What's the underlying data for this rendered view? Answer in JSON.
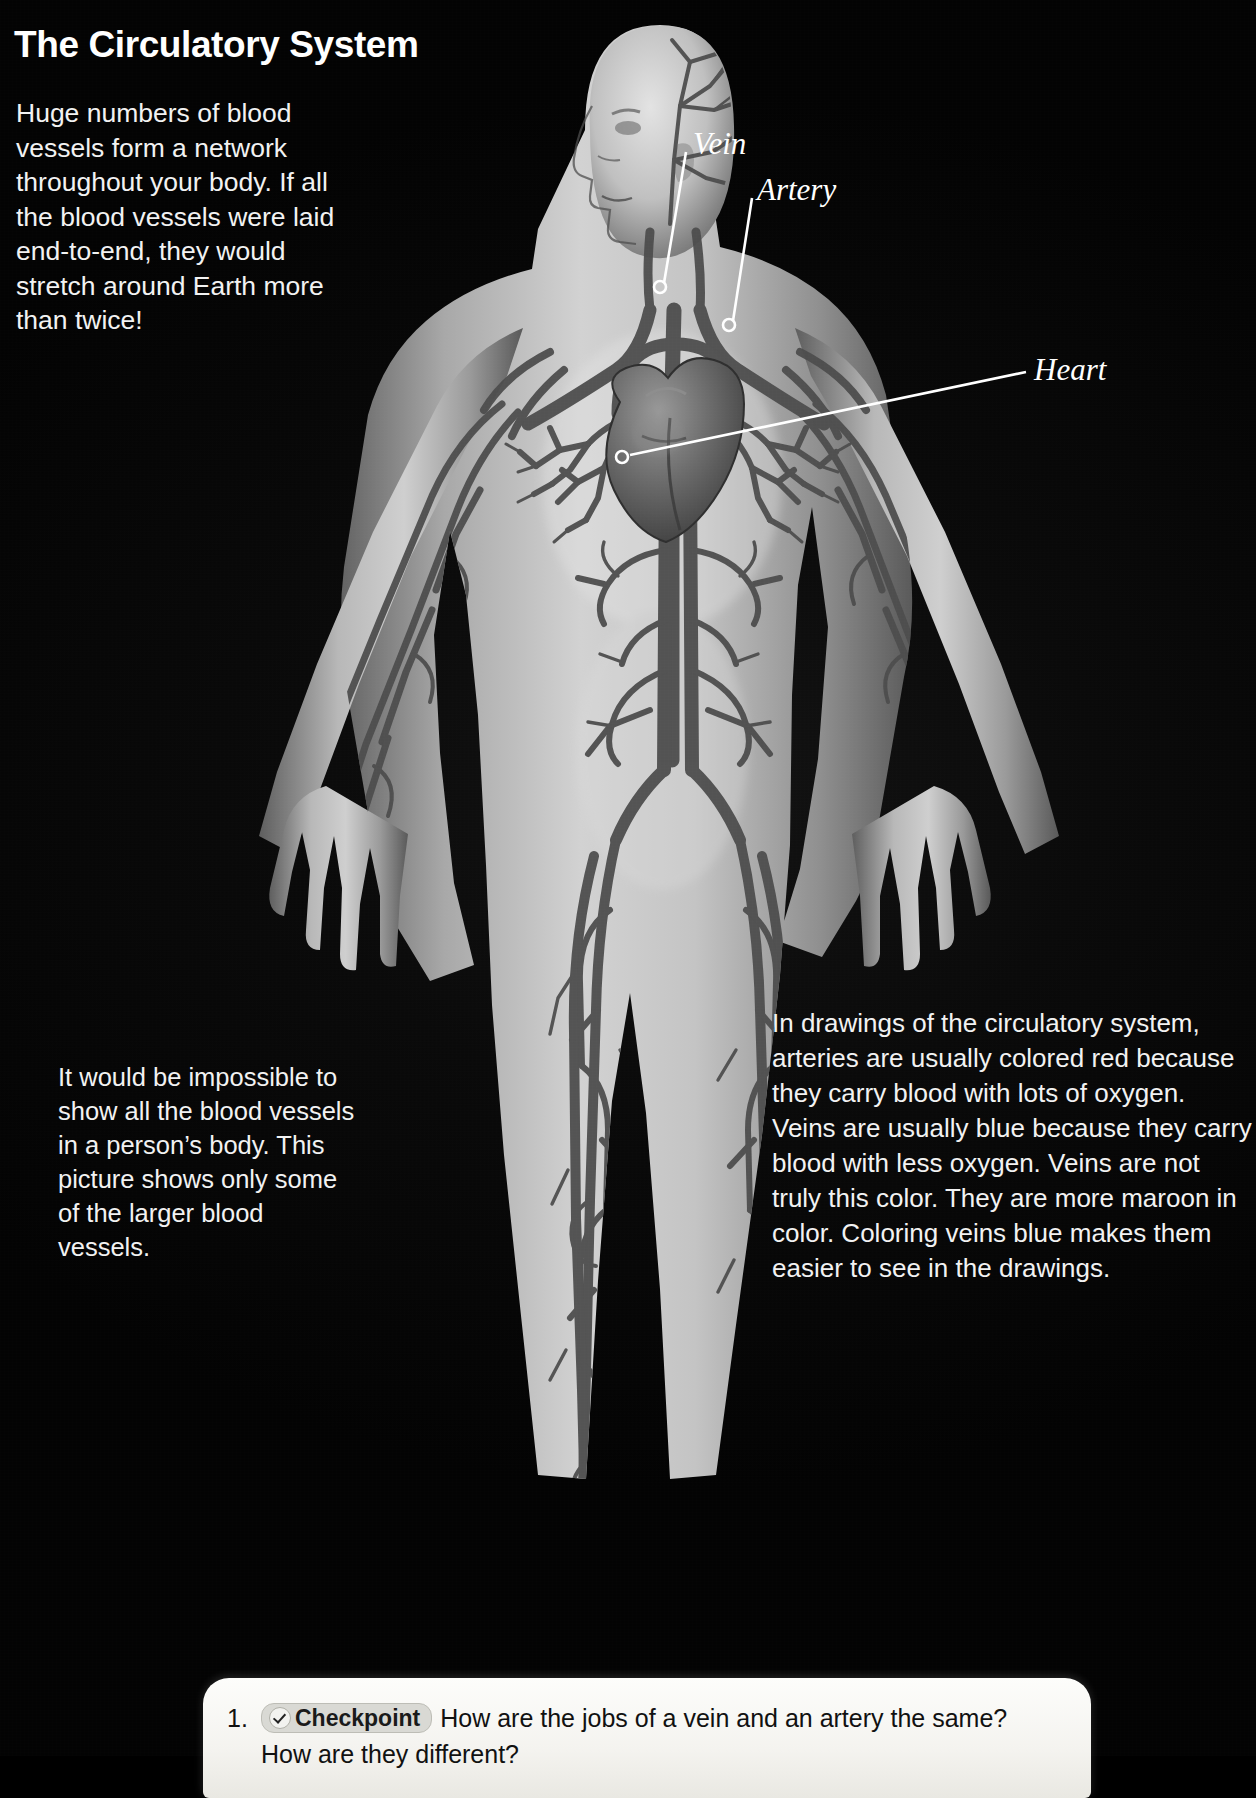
{
  "page": {
    "title": "The Circulatory System",
    "background_color": "#000000",
    "text_color": "#ffffff"
  },
  "intro": {
    "text": "Huge numbers of blood vessels form a network throughout your body. If all the blood vessels were laid end-to-end, they would stretch around Earth more than twice!"
  },
  "figure": {
    "name": "circulatory-system-diagram",
    "callouts": [
      {
        "label": "Vein",
        "label_x": 693,
        "label_y": 126,
        "point_x": 660,
        "point_y": 287
      },
      {
        "label": "Artery",
        "label_x": 757,
        "label_y": 172,
        "point_x": 729,
        "point_y": 325
      },
      {
        "label": "Heart",
        "label_x": 1034,
        "label_y": 352,
        "point_x": 622,
        "point_y": 457
      }
    ]
  },
  "left_caption": {
    "text": "It would be impossible to show all the blood vessels in a person’s body. This picture shows only some of the larger blood vessels."
  },
  "right_caption": {
    "text": "In drawings of the circulatory system, arteries are usually colored red because they carry blood with lots of oxygen. Veins are usually blue because they carry blood with less oxygen. Veins are not truly this color. They are more maroon in color. Coloring veins blue makes them easier to see in the drawings."
  },
  "checkpoint": {
    "number": "1.",
    "badge_label": "Checkpoint",
    "badge_icon": "checkmark-icon",
    "question": "How are the jobs of a vein and an artery the same? How are they different?"
  }
}
